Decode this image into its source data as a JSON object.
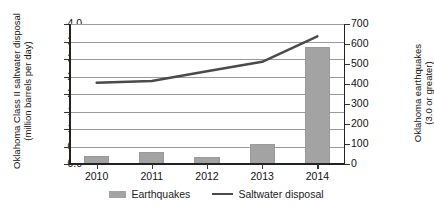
{
  "chart_data": {
    "type": "bar",
    "title": "",
    "subtitle": "",
    "categories": [
      "2010",
      "2011",
      "2012",
      "2013",
      "2014"
    ],
    "xlabel": "",
    "grid": "horizontal",
    "legend_position": "bottom",
    "series": [
      {
        "name": "Earthquakes",
        "type": "bar",
        "axis": "right",
        "color": "#a3a3a3",
        "values": [
          38,
          60,
          35,
          100,
          585
        ]
      },
      {
        "name": "Saltwater disposal",
        "type": "line",
        "axis": "left",
        "color": "#4a4a4a",
        "values": [
          2.32,
          2.37,
          2.65,
          2.92,
          3.65
        ]
      }
    ],
    "left_axis": {
      "label_line1": "Oklahoma Class II saltwater disposal",
      "label_line2": "(million barrels per day)",
      "ylim": [
        0.0,
        4.0
      ],
      "ticks": [
        "4.0",
        "3.5",
        "3.0",
        "2.5",
        "2.0",
        "1.5",
        "1.0",
        "0.5",
        "0.0"
      ],
      "tick_values": [
        4.0,
        3.5,
        3.0,
        2.5,
        2.0,
        1.5,
        1.0,
        0.5,
        0.0
      ]
    },
    "right_axis": {
      "label_line1": "Oklahoma earthquakes",
      "label_line2": "(3.0 or greater)",
      "ylim": [
        0,
        700
      ],
      "ticks": [
        "700",
        "600",
        "500",
        "400",
        "300",
        "200",
        "100",
        "0"
      ],
      "tick_values": [
        700,
        600,
        500,
        400,
        300,
        200,
        100,
        0
      ]
    },
    "legend": [
      {
        "label": "Earthquakes",
        "marker": "bar",
        "color": "#a3a3a3"
      },
      {
        "label": "Saltwater disposal",
        "marker": "line",
        "color": "#4a4a4a"
      }
    ]
  }
}
